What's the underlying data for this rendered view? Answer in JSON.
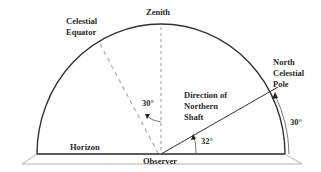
{
  "diagram": {
    "labels": {
      "zenith": "Zenith",
      "celestial_equator_1": "Celestial",
      "celestial_equator_2": "Equator",
      "north_celestial_pole_1": "North",
      "north_celestial_pole_2": "Celestial",
      "north_celestial_pole_3": "Pole",
      "direction_1": "Direction of",
      "direction_2": "Northern",
      "direction_3": "Shaft",
      "horizon": "Horizon",
      "observer": "Observer",
      "angle_equator": "30°",
      "angle_shaft": "32°",
      "angle_pole": "30°"
    },
    "colors": {
      "line": "#333333",
      "dashed": "#9a9a9a",
      "ground": "#b8b8b8"
    }
  }
}
